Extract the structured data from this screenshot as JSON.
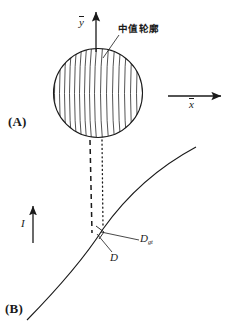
{
  "figure": {
    "type": "schematic-diagram",
    "width": 226,
    "height": 324,
    "background_color": "#ffffff",
    "stroke_color": "#1a1a1a"
  },
  "panels": [
    {
      "id": "A",
      "label": "(A)"
    },
    {
      "id": "B",
      "label": "(B)"
    }
  ],
  "axes": {
    "y": {
      "label": "y",
      "overbar": true,
      "direction": "up",
      "arrow": true
    },
    "x": {
      "label": "x",
      "overbar": true,
      "direction": "right",
      "arrow": true
    }
  },
  "annotations": {
    "median_contour": {
      "label": "中值轮廓",
      "leader_line": true
    },
    "current": {
      "label": "I",
      "arrow": true,
      "direction": "up"
    },
    "distance_d": {
      "label": "D",
      "leader_line": true
    },
    "distance_dgt": {
      "label": "D",
      "subscript": "gt",
      "leader_line": true
    },
    "right_angle_marker": {
      "present": true
    }
  },
  "shapes": {
    "hatched_circle": {
      "center_x": 98,
      "center_y": 93,
      "radius": 45,
      "hatch": "curved-vertical",
      "hatch_count": 17
    },
    "boundary_curve": {
      "description": "concave-down arc from lower-left to upper-right",
      "style": "solid"
    },
    "vertical_dashed_line": {
      "style": "dashed"
    },
    "vertical_dotted_line": {
      "style": "dotted"
    }
  }
}
